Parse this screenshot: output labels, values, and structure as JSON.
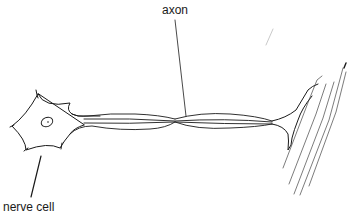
{
  "diagram": {
    "labels": {
      "axon": "axon",
      "nerve_cell": "nerve cell"
    },
    "colors": {
      "ink": "#1a1a1a",
      "faint_ink": "#555555",
      "background": "#ffffff"
    },
    "parts": [
      {
        "id": "cell-body",
        "name": "nerve cell body"
      },
      {
        "id": "nucleus",
        "name": "nucleus"
      },
      {
        "id": "axon",
        "name": "axon"
      },
      {
        "id": "axon-terminal",
        "name": "axon terminal / motor end plate"
      },
      {
        "id": "muscle-fibres",
        "name": "muscle fibres"
      }
    ]
  }
}
